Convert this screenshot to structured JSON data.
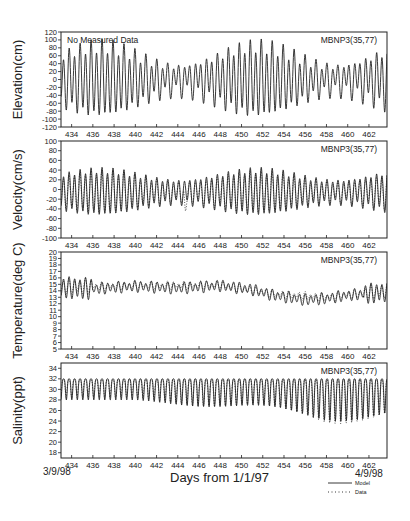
{
  "chart_data": [
    {
      "type": "line",
      "panel": "elevation",
      "ylabel": "Elevation(cm)",
      "ylim": [
        -120,
        120
      ],
      "yticks": [
        -120,
        -100,
        -80,
        -60,
        -40,
        -20,
        0,
        20,
        40,
        60,
        80,
        100,
        120
      ],
      "xlim": [
        433,
        463.7
      ],
      "xticks": [
        434,
        436,
        438,
        440,
        442,
        444,
        446,
        448,
        450,
        452,
        454,
        456,
        458,
        460,
        462
      ],
      "annotation_left": "No Measured Data",
      "annotation_right": "MBNP3(35,77)",
      "series": [
        {
          "name": "Model",
          "style": "solid",
          "mean": 0,
          "amp_range": [
            25,
            85
          ],
          "period_days": 0.517,
          "description": "semidiurnal tide, spring-neap modulation, peaks ~±90 cm around days 435, 450-454"
        }
      ]
    },
    {
      "type": "line",
      "panel": "velocity",
      "ylabel": "Velocity(cm/s)",
      "ylim": [
        -100,
        100
      ],
      "yticks": [
        -100,
        -80,
        -60,
        -40,
        -20,
        0,
        20,
        40,
        60,
        80,
        100
      ],
      "xlim": [
        433,
        463.7
      ],
      "xticks": [
        434,
        436,
        438,
        440,
        442,
        444,
        446,
        448,
        450,
        452,
        454,
        456,
        458,
        460,
        462
      ],
      "annotation_right": "MBNP3(35,77)",
      "series": [
        {
          "name": "Model",
          "style": "solid",
          "mean": -5,
          "amp_range": [
            20,
            45
          ],
          "period_days": 0.517
        },
        {
          "name": "Data",
          "style": "dotted",
          "mean": -5,
          "amp_range": [
            15,
            40
          ],
          "period_days": 0.517,
          "note": "spike to about -60 near day 444.7"
        }
      ]
    },
    {
      "type": "line",
      "panel": "temperature",
      "ylabel": "Temperature(deg C)",
      "ylim": [
        5,
        20
      ],
      "yticks": [
        5,
        6,
        7,
        8,
        9,
        10,
        11,
        12,
        13,
        14,
        15,
        16,
        17,
        18,
        19,
        20
      ],
      "xlim": [
        433,
        463.7
      ],
      "xticks": [
        434,
        436,
        438,
        440,
        442,
        444,
        446,
        448,
        450,
        452,
        454,
        456,
        458,
        460,
        462
      ],
      "annotation_right": "MBNP3(35,77)",
      "series": [
        {
          "name": "Model",
          "style": "solid",
          "mean_profile": [
            [
              433,
              14.5
            ],
            [
              436,
              14.3
            ],
            [
              440,
              14.7
            ],
            [
              444,
              14.4
            ],
            [
              448,
              14.8
            ],
            [
              451,
              14.2
            ],
            [
              453,
              13.3
            ],
            [
              456,
              12.6
            ],
            [
              458,
              12.8
            ],
            [
              460,
              13.3
            ],
            [
              463.7,
              13.8
            ]
          ],
          "amp_range": [
            0.3,
            1.5
          ],
          "period_days": 0.517
        },
        {
          "name": "Data",
          "style": "dotted",
          "mean_profile": [
            [
              433,
              14.6
            ],
            [
              440,
              14.8
            ],
            [
              448,
              14.9
            ],
            [
              453,
              13.5
            ],
            [
              458,
              13.0
            ],
            [
              463.7,
              14.0
            ]
          ],
          "amp_range": [
            0.2,
            1.0
          ],
          "period_days": 0.517
        }
      ]
    },
    {
      "type": "line",
      "panel": "salinity",
      "ylabel": "Salinity(ppt)",
      "ylim": [
        17,
        35
      ],
      "yticks": [
        18,
        20,
        22,
        24,
        26,
        28,
        30,
        32,
        34
      ],
      "xlim": [
        433,
        463.7
      ],
      "xticks": [
        434,
        436,
        438,
        440,
        442,
        444,
        446,
        448,
        450,
        452,
        454,
        456,
        458,
        460,
        462
      ],
      "annotation_right": "MBNP3(35,77)",
      "series": [
        {
          "name": "Model",
          "style": "solid",
          "max": 32,
          "min_range": [
            28,
            24
          ],
          "period_days": 0.517
        },
        {
          "name": "Data",
          "style": "dotted",
          "max": 31.8,
          "min_range": [
            28.5,
            23.5
          ],
          "period_days": 0.517
        }
      ]
    }
  ],
  "figure": {
    "xlabel": "Days from 1/1/97",
    "start_date": "3/9/98",
    "end_date": "4/9/98",
    "legend": [
      {
        "label": "Model",
        "style": "solid"
      },
      {
        "label": "Data",
        "style": "dotted"
      }
    ]
  }
}
